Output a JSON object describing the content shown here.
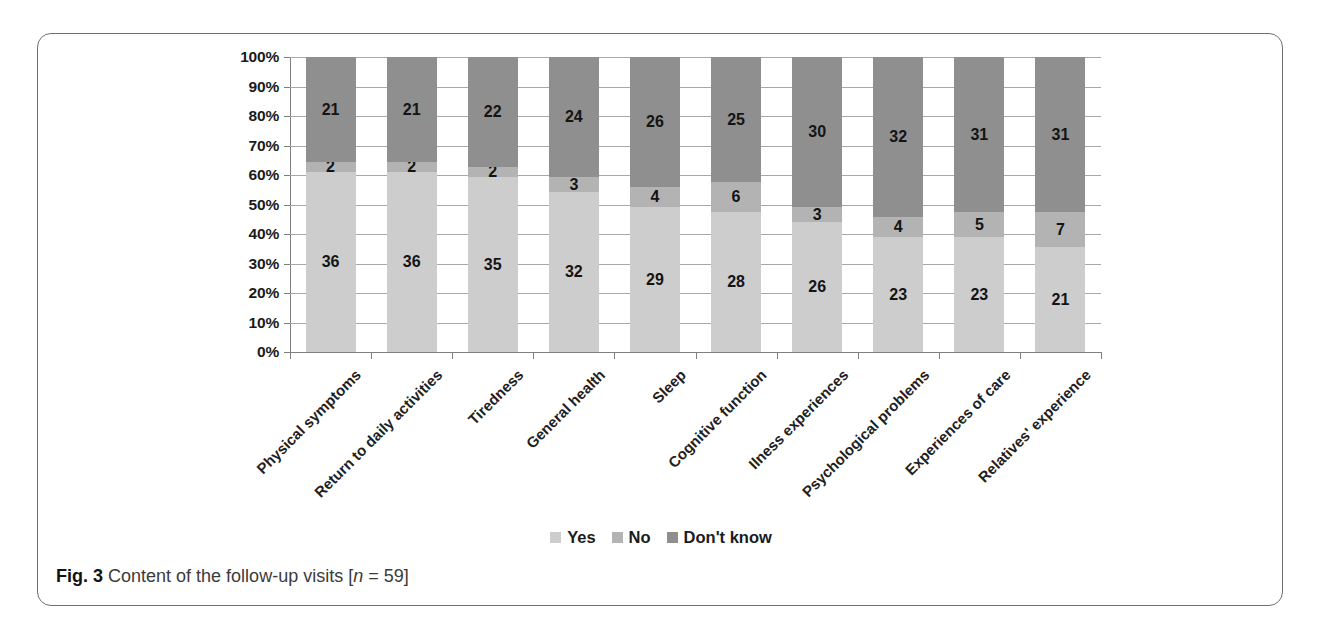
{
  "figure": {
    "caption_label": "Fig. 3",
    "caption_text": "Content of the follow-up visits [",
    "caption_n_symbol": "n",
    "caption_n_value": " = 59]"
  },
  "legend": {
    "position": "bottom-center",
    "items": [
      {
        "label": "Yes",
        "color": "#cdcdcd",
        "swatch_name": "legend-swatch-yes"
      },
      {
        "label": "No",
        "color": "#b3b3b3",
        "swatch_name": "legend-swatch-no"
      },
      {
        "label": "Don't know",
        "color": "#8f8f8f",
        "swatch_name": "legend-swatch-dont-know"
      }
    ]
  },
  "axis": {
    "y_tick_labels": [
      "100%",
      "90%",
      "80%",
      "70%",
      "60%",
      "50%",
      "40%",
      "30%",
      "20%",
      "10%",
      "0%"
    ]
  },
  "chart_data": {
    "type": "bar",
    "stacked": true,
    "normalized": true,
    "title": "",
    "subtitle": "",
    "xlabel": "",
    "ylabel": "",
    "ylim": [
      0,
      100
    ],
    "yticks": [
      0,
      10,
      20,
      30,
      40,
      50,
      60,
      70,
      80,
      90,
      100
    ],
    "ytick_labels": [
      "0%",
      "10%",
      "20%",
      "30%",
      "40%",
      "50%",
      "60%",
      "70%",
      "80%",
      "90%",
      "100%"
    ],
    "grid": true,
    "legend_position": "bottom",
    "total_per_category": 59,
    "categories": [
      "Physical symptoms",
      "Return to daily activities",
      "Tiredness",
      "General health",
      "Sleep",
      "Cognitive function",
      "Ilness experiences",
      "Psychological problems",
      "Experiences of care",
      "Relatives' experience"
    ],
    "series": [
      {
        "name": "Yes",
        "color": "#cdcdcd",
        "values": [
          36,
          36,
          35,
          32,
          29,
          28,
          26,
          23,
          23,
          21
        ]
      },
      {
        "name": "No",
        "color": "#b3b3b3",
        "values": [
          2,
          2,
          2,
          3,
          4,
          6,
          3,
          4,
          5,
          7
        ]
      },
      {
        "name": "Don't know",
        "color": "#8f8f8f",
        "values": [
          21,
          21,
          22,
          24,
          26,
          25,
          30,
          32,
          31,
          31
        ]
      }
    ]
  }
}
